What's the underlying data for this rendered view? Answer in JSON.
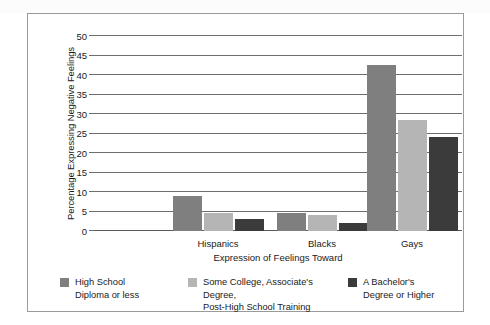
{
  "chart_data": {
    "type": "bar",
    "title": "",
    "xlabel": "Expression of Feelings Toward",
    "ylabel": "Percentage Expressing Negative Feelings",
    "categories": [
      "Hispanics",
      "Blacks",
      "Gays"
    ],
    "ylim": [
      0,
      50
    ],
    "yticks": [
      0,
      5,
      10,
      15,
      20,
      25,
      30,
      35,
      40,
      45,
      50
    ],
    "ytick_labels": [
      "0",
      "5",
      "10",
      "15",
      "20",
      "25",
      "30",
      "35",
      "40",
      "45",
      "50"
    ],
    "grid": true,
    "legend_position": "bottom",
    "series": [
      {
        "name": "High School Diploma or less",
        "name_line1": "High School",
        "name_line2": "Diploma or less",
        "color": "#7f7f7f",
        "values": [
          9,
          4.5,
          42.5
        ]
      },
      {
        "name": "Some College, Associate's Degree, Post-High School Training",
        "name_line1": "Some College, Associate's Degree,",
        "name_line2": "Post-High School Training",
        "color": "#b5b5b5",
        "values": [
          4.5,
          4,
          28.5
        ]
      },
      {
        "name": "A Bachelor's Degree or Higher",
        "name_line1": "A Bachelor's",
        "name_line2": "Degree or Higher",
        "color": "#3b3b3b",
        "values": [
          3,
          2,
          24
        ]
      }
    ]
  },
  "colors": {
    "series_1": "#7f7f7f",
    "series_2": "#b5b5b5",
    "series_3": "#3b3b3b",
    "gridline": "#6e6e6e",
    "frame": "#9a9a9a",
    "text": "#1a1a1a"
  }
}
